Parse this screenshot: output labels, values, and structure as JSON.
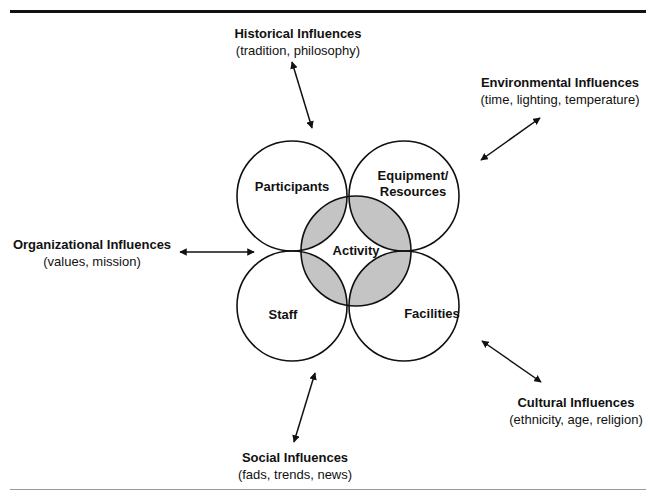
{
  "diagram": {
    "center": {
      "label": "Activity"
    },
    "circles": [
      {
        "id": "participants",
        "label": "Participants"
      },
      {
        "id": "equipment",
        "label_line1": "Equipment/",
        "label_line2": "Resources"
      },
      {
        "id": "staff",
        "label": "Staff"
      },
      {
        "id": "facilities",
        "label": "Facilities"
      }
    ],
    "influences": {
      "historical": {
        "title": "Historical Influences",
        "subtitle": "(tradition, philosophy)"
      },
      "environmental": {
        "title": "Environmental Influences",
        "subtitle": "(time, lighting, temperature)"
      },
      "organizational": {
        "title": "Organizational Influences",
        "subtitle": "(values, mission)"
      },
      "cultural": {
        "title": "Cultural Influences",
        "subtitle": "(ethnicity, age, religion)"
      },
      "social": {
        "title": "Social Influences",
        "subtitle": "(fads, trends, news)"
      }
    },
    "colors": {
      "stroke": "#111111",
      "overlap_fill": "#c4c4c4",
      "background": "#ffffff"
    }
  }
}
